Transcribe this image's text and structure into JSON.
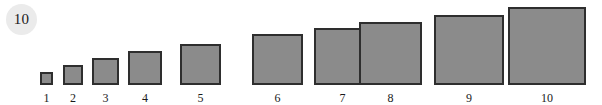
{
  "badge": {
    "label": "10",
    "background_color": "#ebebeb",
    "text_color": "#1a1a1a"
  },
  "chart_data": {
    "type": "bar",
    "title": "",
    "subtitle": "",
    "xlabel": "",
    "ylabel": "",
    "categories": [
      "1",
      "2",
      "3",
      "4",
      "5",
      "6",
      "7",
      "8",
      "9",
      "10"
    ],
    "values": [
      13,
      20,
      27,
      34,
      41,
      51,
      57,
      63,
      70,
      78
    ],
    "value_unit": "px (square side length)",
    "ylim": [
      0,
      78
    ],
    "grid": false,
    "legend": null,
    "annotations": [
      "10"
    ],
    "series": [
      {
        "name": "square size",
        "values": [
          13,
          20,
          27,
          34,
          41,
          51,
          57,
          63,
          70,
          78
        ]
      }
    ],
    "marker_shape": "square",
    "fill_color": "#8b8b8b",
    "border_color": "#2e2e2e",
    "baseline_aligned": true,
    "background_color": "#ffffff"
  },
  "squares": [
    {
      "label": "1",
      "size": 13,
      "left": 40,
      "center": 46.5
    },
    {
      "label": "2",
      "size": 20,
      "left": 63,
      "center": 73
    },
    {
      "label": "3",
      "size": 27,
      "left": 92,
      "center": 105.5
    },
    {
      "label": "4",
      "size": 34,
      "left": 128,
      "center": 145
    },
    {
      "label": "5",
      "size": 41,
      "left": 180,
      "center": 200.5
    },
    {
      "label": "6",
      "size": 51,
      "left": 252,
      "center": 277.5
    },
    {
      "label": "7",
      "size": 57,
      "left": 314,
      "center": 342.5
    },
    {
      "label": "8",
      "size": 63,
      "left": 359,
      "center": 390.5
    },
    {
      "label": "9",
      "size": 70,
      "left": 434,
      "center": 469
    },
    {
      "label": "10",
      "size": 78,
      "left": 508,
      "center": 547
    }
  ]
}
